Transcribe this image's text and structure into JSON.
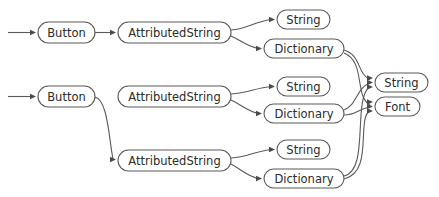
{
  "diagram": {
    "background_color": "#ffffff",
    "node_fill": "#ffffff",
    "node_stroke": "#5a5a5a",
    "label_color": "#2b2b2b",
    "edge_color": "#5a5a5a",
    "arrowhead_color": "#4a4a4a",
    "nodes": [
      {
        "id": "button-1",
        "label": "Button",
        "x": 38,
        "y": 22,
        "w": 57,
        "h": 21
      },
      {
        "id": "attributedstring-1",
        "label": "AttributedString",
        "x": 118,
        "y": 22,
        "w": 113,
        "h": 21
      },
      {
        "id": "string-1",
        "label": "String",
        "x": 277,
        "y": 10,
        "w": 53,
        "h": 19
      },
      {
        "id": "dictionary-1",
        "label": "Dictionary",
        "x": 264,
        "y": 39,
        "w": 80,
        "h": 19
      },
      {
        "id": "button-2",
        "label": "Button",
        "x": 38,
        "y": 86,
        "w": 57,
        "h": 21
      },
      {
        "id": "attributedstring-2",
        "label": "AttributedString",
        "x": 118,
        "y": 86,
        "w": 113,
        "h": 21
      },
      {
        "id": "string-2",
        "label": "String",
        "x": 277,
        "y": 77,
        "w": 53,
        "h": 19
      },
      {
        "id": "dictionary-2",
        "label": "Dictionary",
        "x": 264,
        "y": 104,
        "w": 80,
        "h": 19
      },
      {
        "id": "attributedstring-3",
        "label": "AttributedString",
        "x": 118,
        "y": 150,
        "w": 113,
        "h": 21
      },
      {
        "id": "string-3",
        "label": "String",
        "x": 277,
        "y": 140,
        "w": 53,
        "h": 19
      },
      {
        "id": "dictionary-3",
        "label": "Dictionary",
        "x": 264,
        "y": 169,
        "w": 80,
        "h": 19
      },
      {
        "id": "string-shared",
        "label": "String",
        "x": 375,
        "y": 73,
        "w": 53,
        "h": 19
      },
      {
        "id": "font-shared",
        "label": "Font",
        "x": 375,
        "y": 97,
        "w": 45,
        "h": 19
      }
    ],
    "edges": [
      {
        "id": "edge-root-button-1",
        "from": "root",
        "to": "button-1",
        "path": "M 8,32.5 L 33,32.5"
      },
      {
        "id": "edge-button-1-as-1",
        "from": "button-1",
        "to": "attributedstring-1",
        "path": "M 95,32.5 L 113,32.5"
      },
      {
        "id": "edge-as-1-string-1",
        "from": "attributedstring-1",
        "to": "string-1",
        "path": "M 231,30 C 248,29 255,21 272,19.5"
      },
      {
        "id": "edge-as-1-dict-1",
        "from": "attributedstring-1",
        "to": "dictionary-1",
        "path": "M 231,36 C 242,41 248,47 259,48.5"
      },
      {
        "id": "edge-root-button-2",
        "from": "root",
        "to": "button-2",
        "path": "M 8,96.5 L 33,96.5"
      },
      {
        "id": "edge-button-2-as-3",
        "from": "button-2",
        "to": "attributedstring-3",
        "path": "M 95,97 C 108,100 109,140 113,159"
      },
      {
        "id": "edge-as-2-string-2",
        "from": "attributedstring-2",
        "to": "string-2",
        "path": "M 231,94 C 248,93 255,88 272,86.5"
      },
      {
        "id": "edge-as-2-dict-2",
        "from": "attributedstring-2",
        "to": "dictionary-2",
        "path": "M 231,100 C 242,105 248,112 259,113.5"
      },
      {
        "id": "edge-as-3-string-3",
        "from": "attributedstring-3",
        "to": "string-3",
        "path": "M 231,158 C 248,157 255,151 272,149.5"
      },
      {
        "id": "edge-as-3-dict-3",
        "from": "attributedstring-3",
        "to": "dictionary-3",
        "path": "M 231,164 C 242,170 248,177 259,178.5"
      },
      {
        "id": "edge-dict-1-string",
        "from": "dictionary-1",
        "to": "string-shared",
        "path": "M 344,50 C 362,56 356,72 370,80"
      },
      {
        "id": "edge-dict-1-font",
        "from": "dictionary-1",
        "to": "font-shared",
        "path": "M 344,53 C 366,62 354,96 370,105"
      },
      {
        "id": "edge-dict-2-string",
        "from": "dictionary-2",
        "to": "string-shared",
        "path": "M 344,110 C 358,104 356,88 370,83"
      },
      {
        "id": "edge-dict-2-font",
        "from": "dictionary-2",
        "to": "font-shared",
        "path": "M 344,115 C 356,115 358,109 370,107"
      },
      {
        "id": "edge-dict-3-string",
        "from": "dictionary-3",
        "to": "string-shared",
        "path": "M 344,176 C 370,170 352,100 370,86"
      },
      {
        "id": "edge-dict-3-font",
        "from": "dictionary-3",
        "to": "font-shared",
        "path": "M 344,179 C 374,172 356,120 370,110"
      }
    ],
    "arrowheads": [
      {
        "id": "head-button-1",
        "target": "button-1",
        "x": 36,
        "y": 32.5
      },
      {
        "id": "head-as-1",
        "target": "attributedstring-1",
        "x": 116,
        "y": 32.5
      },
      {
        "id": "head-string-1",
        "target": "string-1",
        "x": 275,
        "y": 19.5
      },
      {
        "id": "head-dict-1",
        "target": "dictionary-1",
        "x": 262,
        "y": 48.5
      },
      {
        "id": "head-button-2",
        "target": "button-2",
        "x": 36,
        "y": 96.5
      },
      {
        "id": "head-as-3",
        "target": "attributedstring-3",
        "x": 116,
        "y": 159.5
      },
      {
        "id": "head-string-2",
        "target": "string-2",
        "x": 275,
        "y": 86.5
      },
      {
        "id": "head-dict-2",
        "target": "dictionary-2",
        "x": 262,
        "y": 113.5
      },
      {
        "id": "head-string-3",
        "target": "string-3",
        "x": 275,
        "y": 149.5
      },
      {
        "id": "head-dict-3",
        "target": "dictionary-3",
        "x": 262,
        "y": 178.5
      },
      {
        "id": "head-string-shared-a",
        "target": "string-shared",
        "x": 373,
        "y": 78
      },
      {
        "id": "head-string-shared-b",
        "target": "string-shared",
        "x": 373,
        "y": 82.5
      },
      {
        "id": "head-string-shared-c",
        "target": "string-shared",
        "x": 373,
        "y": 87
      },
      {
        "id": "head-font-shared-a",
        "target": "font-shared",
        "x": 373,
        "y": 102
      },
      {
        "id": "head-font-shared-b",
        "target": "font-shared",
        "x": 373,
        "y": 106.5
      },
      {
        "id": "head-font-shared-c",
        "target": "font-shared",
        "x": 373,
        "y": 111
      }
    ]
  }
}
